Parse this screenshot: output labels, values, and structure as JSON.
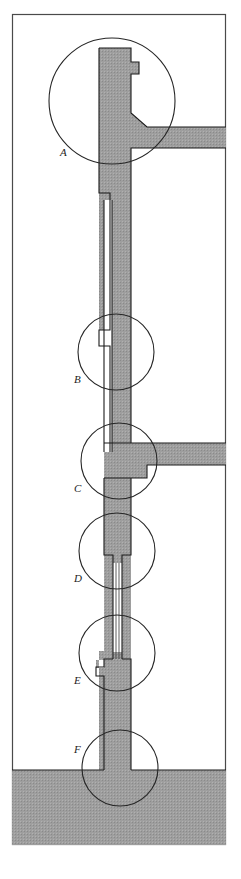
{
  "figure": {
    "frame": {
      "x": 12,
      "y": 14,
      "width": 214,
      "height": 831,
      "stroke": "#4a4a4a",
      "fill": "#ffffff"
    },
    "colors": {
      "material_fill": "#9b9b9b",
      "outline": "#1a1a1a",
      "frame_stroke": "#4a4a4a",
      "bore_fill": "#ffffff",
      "callout_circle_stroke": "#262626",
      "label_color": "#1d1d1d",
      "background": "#ffffff"
    },
    "detail_labels": [
      {
        "id": "A",
        "text": "A",
        "label_x": 60,
        "label_y": 156,
        "circle_cx": 112,
        "circle_cy": 101,
        "circle_r": 63
      },
      {
        "id": "B",
        "text": "B",
        "label_x": 74,
        "label_y": 383,
        "circle_cx": 116,
        "circle_cy": 352,
        "circle_r": 38
      },
      {
        "id": "C",
        "text": "C",
        "label_x": 74,
        "label_y": 492,
        "circle_cx": 119,
        "circle_cy": 461,
        "circle_r": 38
      },
      {
        "id": "D",
        "text": "D",
        "label_x": 74,
        "label_y": 582,
        "circle_cx": 117,
        "circle_cy": 551,
        "circle_r": 38
      },
      {
        "id": "E",
        "text": "E",
        "label_x": 74,
        "label_y": 684,
        "circle_cx": 117,
        "circle_cy": 653,
        "circle_r": 38
      },
      {
        "id": "F",
        "text": "F",
        "label_x": 74,
        "label_y": 753,
        "circle_cx": 120,
        "circle_cy": 768,
        "circle_r": 38
      }
    ],
    "components": {
      "upper_shaft": {
        "name": "upper-shaft-body",
        "path": "M 99 48 L 131 48 L 131 62 L 138 62 L 138 73 L 131 73 L 131 114 L 146 126 L 226 126 L 226 148 L 131 148 L 131 193 L 110 193 L 110 199 L 104 199 L 104 454 L 99 454 Z"
      },
      "upper_branch": {
        "name": "upper-horizontal-branch",
        "path": "M 138 126 L 226 126 L 226 148 L 138 148 Z"
      },
      "bore_channel": {
        "name": "inner-bore-channel",
        "path": "M 104 199 L 110 199 L 110 193 L 112 193 L 112 452 L 104 452 Z"
      },
      "step_b": {
        "name": "shaft-step-detail-b",
        "path": "M 99 330 L 110 330 L 110 345 L 99 345 Z"
      },
      "boss_c": {
        "name": "branch-boss-detail-c",
        "path": "M 104 443 L 146 443 L 146 465 L 226 465 L 226 443 L 146 443 L 146 478 L 104 478 Z"
      },
      "lower_branch": {
        "name": "lower-horizontal-branch",
        "path": "M 146 443 L 226 443 L 226 465 L 146 465 Z"
      },
      "capillary": {
        "name": "capillary-narrow-section",
        "top_y": 563,
        "bottom_y": 651,
        "center_x": 117,
        "outer_width": 7,
        "inner_width": 3
      },
      "lower_shaft": {
        "name": "lower-shaft-body",
        "path": "M 104 651 L 131 651 L 131 770 L 104 770 Z"
      },
      "base_block": {
        "name": "base-block",
        "path": "M 12 770 L 131 770 L 131 845 L 12 845 Z",
        "top_y": 770
      },
      "base_block_right": {
        "name": "base-block-right",
        "path": "M 131 770 L 226 770 L 226 845 L 131 845 Z"
      }
    }
  }
}
